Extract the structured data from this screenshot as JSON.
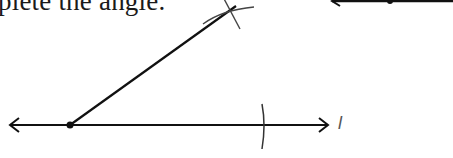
{
  "worksheet": {
    "instruction_text": "plete the angle.",
    "figure": {
      "type": "compass-construction",
      "main_line_label": "l",
      "stroke_color": "#111111",
      "pencil_color": "#444444"
    }
  }
}
